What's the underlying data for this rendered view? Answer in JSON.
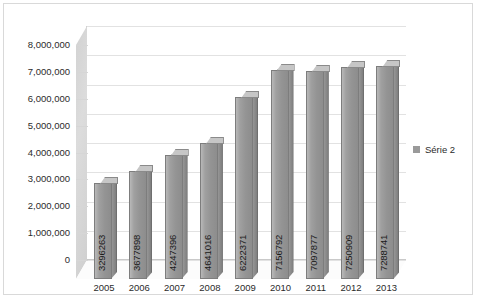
{
  "chart_data": {
    "type": "bar",
    "title": "",
    "xlabel": "",
    "ylabel": "",
    "categories": [
      "2005",
      "2006",
      "2007",
      "2008",
      "2009",
      "2010",
      "2011",
      "2012",
      "2013"
    ],
    "values": [
      3296263,
      3677898,
      4247396,
      4641016,
      6222371,
      7156792,
      7097877,
      7250909,
      7288741
    ],
    "data_labels": [
      "3296263",
      "3677898",
      "4247396",
      "4641016",
      "6222371",
      "7156792",
      "7097877",
      "7250909",
      "7288741"
    ],
    "series": [
      {
        "name": "Série 2",
        "values": [
          3296263,
          3677898,
          4247396,
          4641016,
          6222371,
          7156792,
          7097877,
          7250909,
          7288741
        ]
      }
    ],
    "ylim": [
      0,
      8000000
    ],
    "ytick_step": 1000000,
    "ytick_labels": [
      "8,000,000",
      "7,000,000",
      "6,000,000",
      "5,000,000",
      "4,000,000",
      "3,000,000",
      "2,000,000",
      "1,000,000",
      "0"
    ],
    "ytick_values": [
      8000000,
      7000000,
      6000000,
      5000000,
      4000000,
      3000000,
      2000000,
      1000000,
      0
    ],
    "grid": true,
    "legend_position": "right",
    "legend": [
      "Série 2"
    ],
    "style": "3d-column",
    "bar_color": "#9a9a9a",
    "grid_color": "#e2e2e2",
    "frame_color": "#d9d9d9"
  },
  "legend": {
    "entries": [
      {
        "label": "Série 2",
        "color": "#9a9a9a"
      }
    ]
  }
}
